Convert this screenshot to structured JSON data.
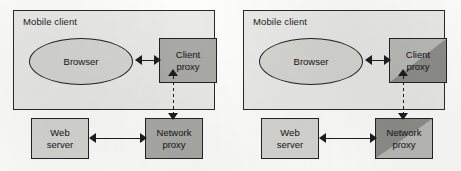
{
  "figure": {
    "panel_count": 2,
    "background_color": "#fdfdfc",
    "colors": {
      "enclosure_fill": "#e9e9e7",
      "light_box_fill": "#d5d5d2",
      "proxy_fill": "#a9a9a6",
      "split_light": "#b9b9b6",
      "split_dark": "#8d8d8a",
      "stroke": "#232323"
    }
  },
  "panels": [
    {
      "id": "left",
      "enclosure_label": "Mobile client",
      "browser_label": "Browser",
      "client_proxy": {
        "line1": "Client",
        "line2": "proxy",
        "shading": "solid"
      },
      "web_server": {
        "line1": "Web",
        "line2": "server"
      },
      "network_proxy": {
        "line1": "Network",
        "line2": "proxy",
        "shading": "solid"
      },
      "connectors": [
        {
          "name": "browser-to-client-proxy",
          "style": "solid",
          "orientation": "horizontal",
          "heads": "both"
        },
        {
          "name": "web-server-to-network-proxy",
          "style": "solid",
          "orientation": "horizontal",
          "heads": "both"
        },
        {
          "name": "client-proxy-to-network-proxy",
          "style": "dashed",
          "orientation": "vertical",
          "heads": "both"
        }
      ]
    },
    {
      "id": "right",
      "enclosure_label": "Mobile client",
      "browser_label": "Browser",
      "client_proxy": {
        "line1": "Client",
        "line2": "proxy",
        "shading": "diagonal-light-upper-left"
      },
      "web_server": {
        "line1": "Web",
        "line2": "server"
      },
      "network_proxy": {
        "line1": "Network",
        "line2": "proxy",
        "shading": "diagonal-dark-upper-left"
      },
      "connectors": [
        {
          "name": "browser-to-client-proxy",
          "style": "solid",
          "orientation": "horizontal",
          "heads": "both"
        },
        {
          "name": "web-server-to-network-proxy",
          "style": "solid",
          "orientation": "horizontal",
          "heads": "both"
        },
        {
          "name": "client-proxy-to-network-proxy",
          "style": "dashed",
          "orientation": "vertical",
          "heads": "both"
        }
      ]
    }
  ]
}
